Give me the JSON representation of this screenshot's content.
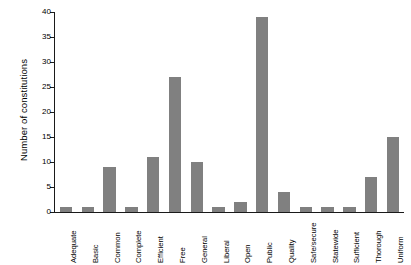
{
  "chart_data": {
    "type": "bar",
    "title": "",
    "subtitle": "",
    "xlabel": "",
    "ylabel": "Number of constitutions",
    "categories": [
      "Adequate",
      "Basic",
      "Common",
      "Complete",
      "Efficient",
      "Free",
      "General",
      "Liberal",
      "Open",
      "Public",
      "Quality",
      "Safe/secure",
      "Statewide",
      "Sufficient",
      "Thorough",
      "Uniform"
    ],
    "values": [
      1,
      1,
      9,
      1,
      11,
      27,
      10,
      1,
      2,
      39,
      4,
      1,
      1,
      1,
      7,
      15
    ],
    "ylim": [
      0,
      40
    ],
    "yticks": [
      0,
      5,
      10,
      15,
      20,
      25,
      30,
      35,
      40
    ],
    "ytick_labels": [
      "0",
      "5",
      "10",
      "15",
      "20",
      "25",
      "30",
      "35",
      "40"
    ],
    "grid": false,
    "legend": false,
    "legend_position": "none",
    "bar_color": "#808080",
    "axis_color": "#1a1a1a",
    "background_color": "#ffffff"
  }
}
